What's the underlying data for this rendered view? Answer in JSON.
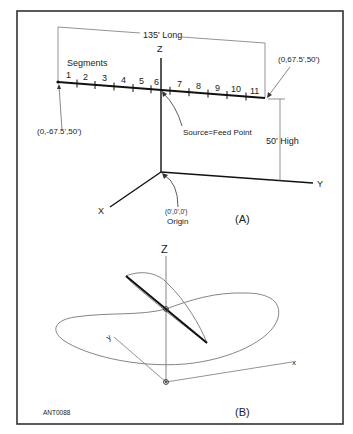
{
  "figure": {
    "id_label": "ANT0088",
    "panel_a": {
      "caption": "(A)",
      "length_dimension": "135' Long",
      "height_dimension": "50' High",
      "segments_label": "Segments",
      "segments": [
        "1",
        "2",
        "3",
        "4",
        "5",
        "6",
        "7",
        "8",
        "9",
        "10",
        "11"
      ],
      "left_end_coord": "(0,-67.5',50')",
      "right_end_coord": "(0,67.5',50')",
      "feed_point_label": "Source=Feed Point",
      "origin_coord": "(0',0',0')",
      "origin_label": "Origin",
      "axis_x": "X",
      "axis_y": "Y",
      "axis_z": "Z"
    },
    "panel_b": {
      "caption": "(B)",
      "axis_z": "Z",
      "axis_x": "x",
      "axis_y": "y"
    }
  },
  "colors": {
    "frame": "#333333",
    "wire": "#111111",
    "thin_line": "#555555",
    "pattern": "#777777"
  }
}
